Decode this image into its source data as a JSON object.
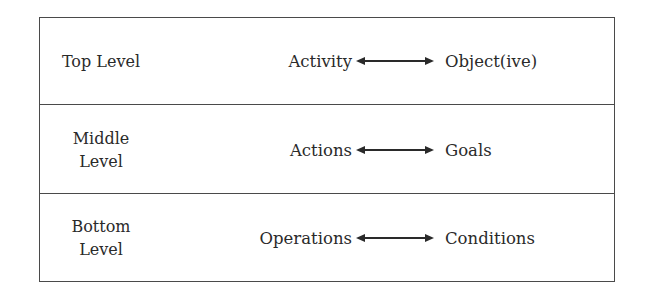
{
  "diagram": {
    "rows": [
      {
        "level": "Top Level",
        "level_lines": [
          "Top Level"
        ],
        "left": "Activity",
        "right": "Object(ive)",
        "connector": "double-headed-arrow"
      },
      {
        "level": "Middle Level",
        "level_lines": [
          "Middle",
          "Level"
        ],
        "left": "Actions",
        "right": "Goals",
        "connector": "double-headed-arrow"
      },
      {
        "level": "Bottom Level",
        "level_lines": [
          "Bottom",
          "Level"
        ],
        "left": "Operations",
        "right": "Conditions",
        "connector": "double-headed-arrow"
      }
    ],
    "colors": {
      "border": "#4a4a4a",
      "text": "#2a2a2a",
      "arrow": "#2a2a2a"
    }
  }
}
